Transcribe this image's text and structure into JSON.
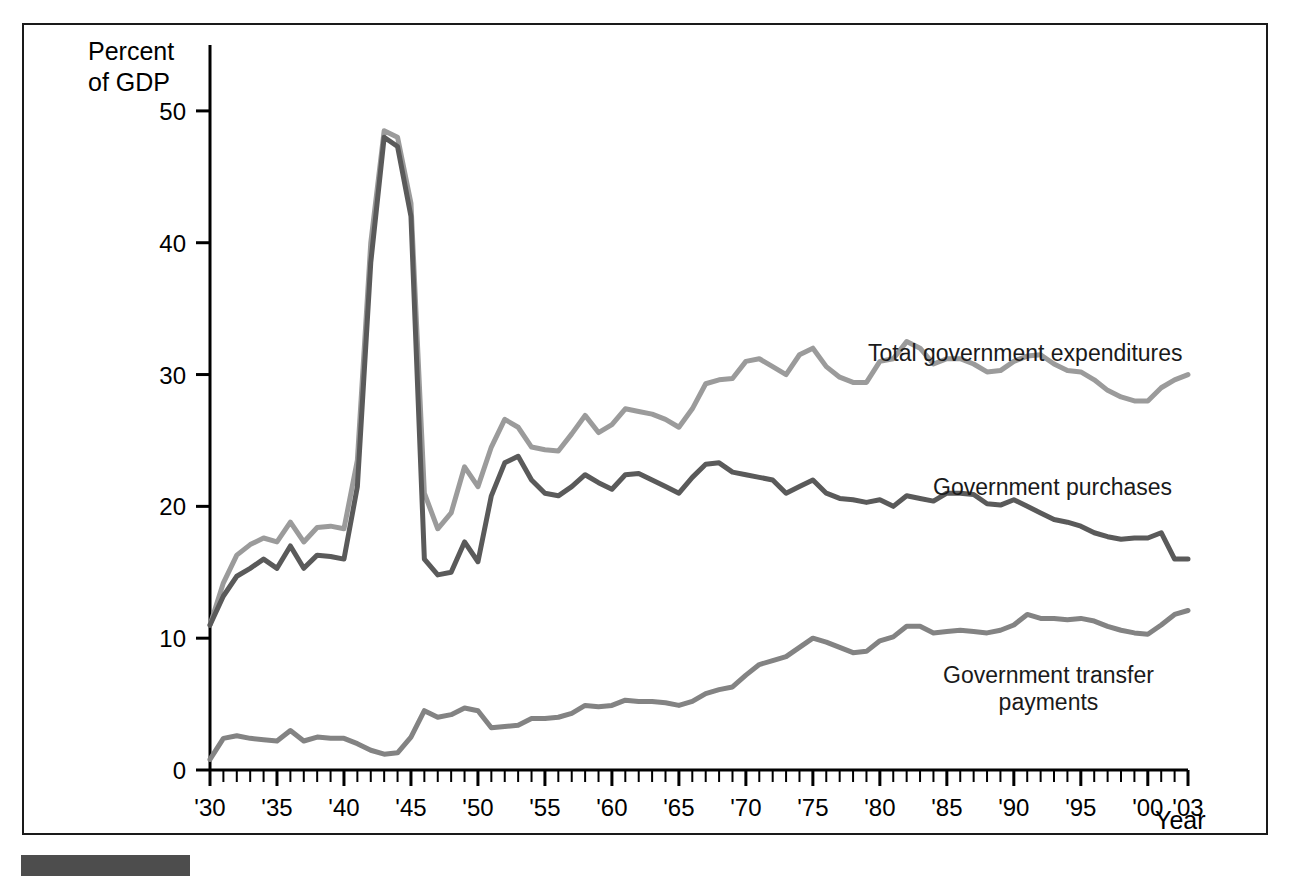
{
  "chart_data": {
    "type": "line",
    "title": "",
    "ylabel": "Percent\nof GDP",
    "xlabel": "Year",
    "ylim": [
      0,
      55
    ],
    "yticks": [
      0,
      10,
      20,
      30,
      40,
      50
    ],
    "ytick_labels": [
      "0",
      "10",
      "20",
      "30",
      "40",
      "50"
    ],
    "xlim": [
      1930,
      2003
    ],
    "xticks": [
      1930,
      1935,
      1940,
      1945,
      1950,
      1955,
      1960,
      1965,
      1970,
      1975,
      1980,
      1985,
      1990,
      1995,
      2000,
      2003
    ],
    "xtick_labels": [
      "'30",
      "'35",
      "'40",
      "'45",
      "'50",
      "'55",
      "'60",
      "'65",
      "'70",
      "'75",
      "'80",
      "'85",
      "'90",
      "'95",
      "'00",
      "'03"
    ],
    "minor_xtick_interval": 1,
    "grid": false,
    "legend_position": "inline-annotations",
    "x": [
      1930,
      1931,
      1932,
      1933,
      1934,
      1935,
      1936,
      1937,
      1938,
      1939,
      1940,
      1941,
      1942,
      1943,
      1944,
      1945,
      1946,
      1947,
      1948,
      1949,
      1950,
      1951,
      1952,
      1953,
      1954,
      1955,
      1956,
      1957,
      1958,
      1959,
      1960,
      1961,
      1962,
      1963,
      1964,
      1965,
      1966,
      1967,
      1968,
      1969,
      1970,
      1971,
      1972,
      1973,
      1974,
      1975,
      1976,
      1977,
      1978,
      1979,
      1980,
      1981,
      1982,
      1983,
      1984,
      1985,
      1986,
      1987,
      1988,
      1989,
      1990,
      1991,
      1992,
      1993,
      1994,
      1995,
      1996,
      1997,
      1998,
      1999,
      2000,
      2001,
      2002,
      2003
    ],
    "series": [
      {
        "name": "Total government expenditures",
        "color": "#9b9b9b",
        "values": [
          11.0,
          14.2,
          16.3,
          17.1,
          17.6,
          17.3,
          18.8,
          17.3,
          18.4,
          18.5,
          18.3,
          23.5,
          40.0,
          48.5,
          48.0,
          43.0,
          21.0,
          18.3,
          19.5,
          23.0,
          21.5,
          24.5,
          26.6,
          26.0,
          24.5,
          24.3,
          24.2,
          25.5,
          26.9,
          25.6,
          26.2,
          27.4,
          27.2,
          27.0,
          26.6,
          26.0,
          27.4,
          29.3,
          29.6,
          29.7,
          31.0,
          31.2,
          30.6,
          30.0,
          31.5,
          32.0,
          30.6,
          29.8,
          29.4,
          29.4,
          31.0,
          31.2,
          32.5,
          32.0,
          30.8,
          31.2,
          31.2,
          30.8,
          30.2,
          30.3,
          31.0,
          31.4,
          31.5,
          30.8,
          30.3,
          30.2,
          29.6,
          28.8,
          28.3,
          28.0,
          28.0,
          29.0,
          29.6,
          30.0
        ]
      },
      {
        "name": "Government purchases",
        "color": "#5a5a5a",
        "values": [
          11.0,
          13.2,
          14.7,
          15.3,
          16.0,
          15.3,
          17.0,
          15.3,
          16.3,
          16.2,
          16.0,
          21.5,
          38.5,
          48.0,
          47.3,
          42.0,
          16.0,
          14.8,
          15.0,
          17.3,
          15.8,
          20.8,
          23.3,
          23.8,
          22.0,
          21.0,
          20.8,
          21.5,
          22.4,
          21.8,
          21.3,
          22.4,
          22.5,
          22.0,
          21.5,
          21.0,
          22.2,
          23.2,
          23.3,
          22.6,
          22.4,
          22.2,
          22.0,
          21.0,
          21.5,
          22.0,
          21.0,
          20.6,
          20.5,
          20.3,
          20.5,
          20.0,
          20.8,
          20.6,
          20.4,
          21.0,
          21.0,
          20.9,
          20.2,
          20.1,
          20.5,
          20.0,
          19.5,
          19.0,
          18.8,
          18.5,
          18.0,
          17.7,
          17.5,
          17.6,
          17.6,
          18.0,
          16.0,
          16.0
        ]
      },
      {
        "name": "Government transfer payments",
        "color": "#838383",
        "values": [
          0.8,
          2.4,
          2.6,
          2.4,
          2.3,
          2.2,
          3.0,
          2.2,
          2.5,
          2.4,
          2.4,
          2.0,
          1.5,
          1.2,
          1.3,
          2.5,
          4.5,
          4.0,
          4.2,
          4.7,
          4.5,
          3.2,
          3.3,
          3.4,
          3.9,
          3.9,
          4.0,
          4.3,
          4.9,
          4.8,
          4.9,
          5.3,
          5.2,
          5.2,
          5.1,
          4.9,
          5.2,
          5.8,
          6.1,
          6.3,
          7.2,
          8.0,
          8.3,
          8.6,
          9.3,
          10.0,
          9.7,
          9.3,
          8.9,
          9.0,
          9.8,
          10.1,
          10.9,
          10.9,
          10.4,
          10.5,
          10.6,
          10.5,
          10.4,
          10.6,
          11.0,
          11.8,
          11.5,
          11.5,
          11.4,
          11.5,
          11.3,
          10.9,
          10.6,
          10.4,
          10.3,
          11.0,
          11.8,
          12.1
        ]
      }
    ]
  },
  "labels": {
    "total": "Total government expenditures",
    "purchases": "Government purchases",
    "transfers": "Government transfer\npayments",
    "ylabel": "Percent\nof GDP",
    "xlabel": "Year"
  }
}
